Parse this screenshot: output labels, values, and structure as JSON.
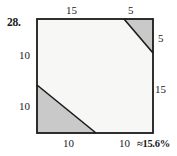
{
  "problem": {
    "number": "28.",
    "answer": "≈15.6%"
  },
  "figure": {
    "type": "geometry-diagram",
    "shape": "square-with-two-shaded-corner-triangles",
    "colors": {
      "shaded": "#c9c9c9",
      "unshaded": "#f7f7f5",
      "outline": "#1a1a1a"
    },
    "square": {
      "side_total": 20,
      "top_segments": [
        "15",
        "5"
      ],
      "right_segments": [
        "5",
        "15"
      ],
      "bottom_segments": [
        "10",
        "10"
      ],
      "left_segments": [
        "10",
        "10"
      ]
    },
    "labels": {
      "top_left": "15",
      "top_right": "5",
      "right_top": "5",
      "right_mid": "15",
      "left_top": "10",
      "left_bottom": "10",
      "bottom_left": "10",
      "bottom_right": "10"
    }
  }
}
